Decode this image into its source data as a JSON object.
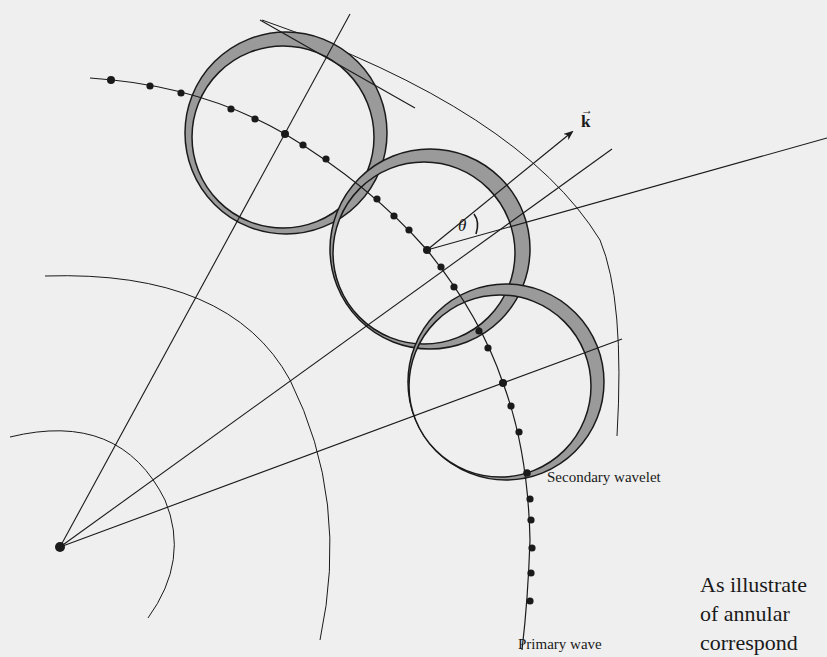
{
  "figure": {
    "labels": {
      "wave_vector": "k",
      "wave_vector_arrow": "→",
      "angle": "θ",
      "secondary_wavelet": "Secondary wavelet",
      "primary_wave": "Primary wave"
    },
    "colors": {
      "background": "#efefef",
      "ink": "#1a1a1a",
      "annulus_fill": "#9a9a9a"
    },
    "source_point": [
      60,
      547
    ],
    "wavelet_centers": [
      [
        285,
        134
      ],
      [
        427,
        250
      ],
      [
        503,
        383
      ]
    ],
    "wavelet_count": 3
  },
  "body_text": {
    "lines": [
      "As illustrate",
      "of  annular",
      "correspond"
    ]
  }
}
